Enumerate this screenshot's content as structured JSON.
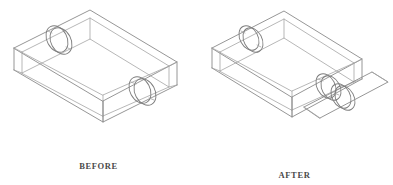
{
  "figure": {
    "kind": "isometric-wireframe-line-drawing",
    "background_color": "#ffffff",
    "line_color": "#8a8a8a",
    "accent_line_color": "#6f6f6f",
    "caption_color": "#4a4a4a"
  },
  "panels": [
    {
      "id": "before",
      "caption": "BEFORE",
      "detail": "Open rectangular box with two circular holes in opposite side walls, all walls attached"
    },
    {
      "id": "after",
      "caption": "AFTER",
      "detail": "Same box with the near-right side wall detached and moved away; detached panel retains its circular hole"
    }
  ],
  "labels": {
    "before": "BEFORE",
    "after": "AFTER"
  },
  "features": {
    "hole_count_before": 2,
    "hole_count_after": 2,
    "detached_panel_count": 1
  }
}
